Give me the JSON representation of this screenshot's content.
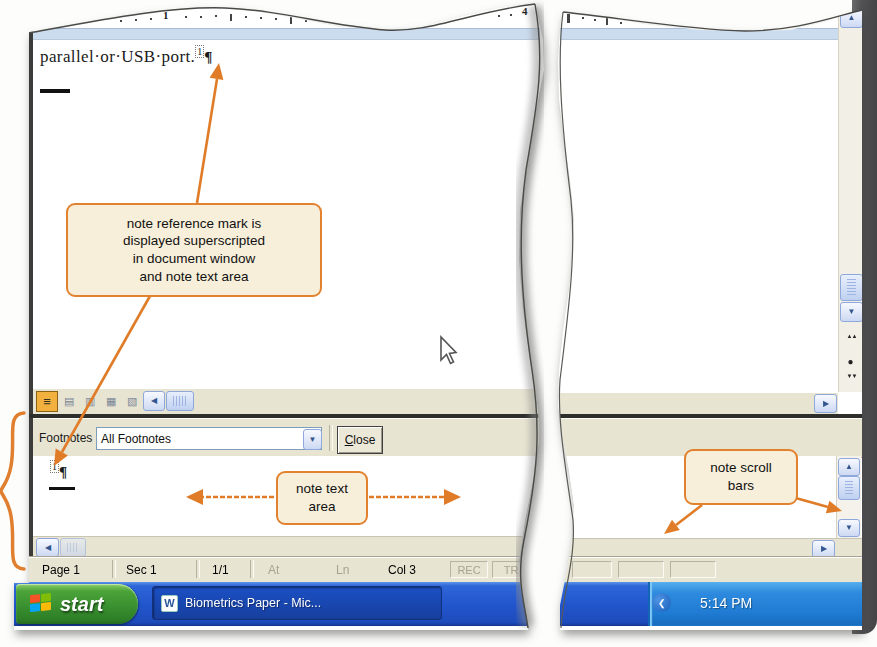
{
  "ruler": {
    "num_1": "1",
    "num_4": "4"
  },
  "document": {
    "text_line": "parallel·or·USB·port.",
    "note_ref": "1",
    "pilcrow": "¶"
  },
  "footnotes_pane": {
    "label": "Footnotes",
    "dropdown_value": "All Footnotes",
    "close_c": "C",
    "close_rest": "lose",
    "note_ref": "1",
    "pilcrow": "¶"
  },
  "status_bar": {
    "page": "Page 1",
    "sec": "Sec 1",
    "pages": "1/1",
    "at": "At",
    "ln": "Ln",
    "col": "Col 3",
    "rec": "REC",
    "trk": "TR"
  },
  "taskbar": {
    "start_label": "start",
    "task_label": "Biometrics Paper - Mic...",
    "clock": "5:14 PM"
  },
  "callouts": {
    "ref_mark": "note reference mark is\ndisplayed superscripted\nin document window\nand note text area",
    "note_text_area": "note text\narea",
    "note_scroll_bars": "note scroll\nbars"
  },
  "icons": {
    "normal_view": "≡",
    "web_layout_view": "▤",
    "print_layout_view": "▥",
    "outline_view": "▦",
    "reading_layout_view": "▧",
    "scroll_left": "◀",
    "scroll_right": "▶",
    "scroll_up": "▲",
    "scroll_down": "▼",
    "combo_arrow": "▼",
    "browse_prev": "▲▲",
    "browse_select": "●",
    "browse_next": "▼▼",
    "word_logo": "W",
    "tray_chevron": "❮"
  },
  "colors": {
    "callout_border": "#e2812e",
    "callout_fill": "#f7efda",
    "pane_gray": "#e8e4d2",
    "ruler_strip": "#ccdcef",
    "taskbar_blue": "#2256cd",
    "start_green": "#3f9a32"
  }
}
